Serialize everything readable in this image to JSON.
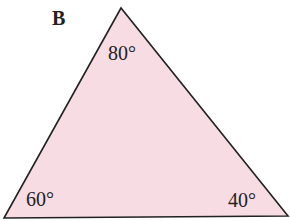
{
  "figure": {
    "label": "B",
    "shape": "triangle",
    "fill_color": "#f7dde3",
    "stroke_color": "#222222",
    "angles": {
      "top": "80°",
      "bottom_left": "60°",
      "bottom_right": "40°"
    }
  }
}
